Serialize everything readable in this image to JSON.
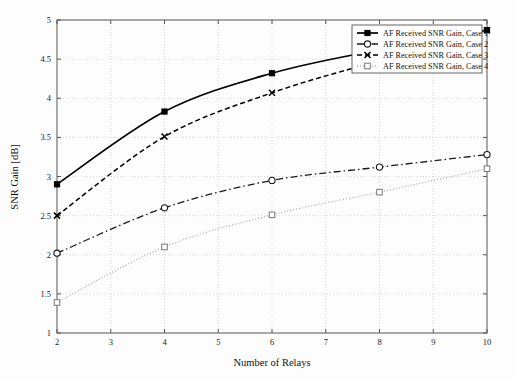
{
  "chart_data": {
    "type": "line",
    "title": "",
    "xlabel": "Number of Relays",
    "ylabel": "SNR Gain [dB]",
    "xlim": [
      2,
      10
    ],
    "ylim": [
      1,
      5
    ],
    "xticks": [
      2,
      3,
      4,
      5,
      6,
      7,
      8,
      9,
      10
    ],
    "yticks": [
      1,
      1.5,
      2,
      2.5,
      3,
      3.5,
      4,
      4.5,
      5
    ],
    "xticklabels": [
      "2",
      "3",
      "4",
      "5",
      "6",
      "7",
      "8",
      "9",
      "10"
    ],
    "yticklabels": [
      "1",
      "1.5",
      "2",
      "2.5",
      "3",
      "3.5",
      "4",
      "4.5",
      "5"
    ],
    "grid": true,
    "legend_position": "upper right",
    "x": [
      2,
      4,
      6,
      8,
      10
    ],
    "series": [
      {
        "name": "AF Received SNR Gain, Case 1",
        "values": [
          2.9,
          3.83,
          4.32,
          4.62,
          4.87
        ],
        "linestyle": "solid",
        "marker": "filled-square",
        "color": "#000000"
      },
      {
        "name": "AF Received SNR Gain, Case 2",
        "values": [
          2.02,
          2.6,
          2.95,
          3.12,
          3.28
        ],
        "linestyle": "dashdot",
        "marker": "open-circle",
        "color": "#1a1a1a"
      },
      {
        "name": "AF Received SNR Gain, Case 3",
        "values": [
          2.5,
          3.51,
          4.07,
          4.48,
          4.87
        ],
        "linestyle": "dashed",
        "marker": "cross-x",
        "color": "#000000"
      },
      {
        "name": "AF Received SNR Gain, Case 4",
        "values": [
          1.39,
          2.1,
          2.51,
          2.8,
          3.1
        ],
        "linestyle": "dotted",
        "marker": "open-square",
        "color": "#b0b0b0"
      }
    ]
  },
  "legend": {
    "entries": [
      "AF Received SNR Gain, Case 1",
      "AF Received SNR Gain, Case 2",
      "AF Received SNR Gain, Case 3",
      "AF Received SNR Gain, Case 4"
    ]
  }
}
